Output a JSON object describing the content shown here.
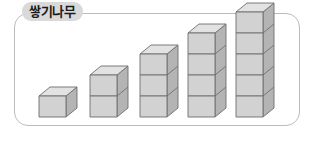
{
  "figure": {
    "title": "쌓기나무",
    "panel": {
      "border_color": "#b9bcbe",
      "background_color": "#ffffff",
      "corner_radius": "14px"
    },
    "badge": {
      "background_color": "#d9d9d9",
      "text_color": "#1a1a1a"
    }
  },
  "chart_data": {
    "type": "bar",
    "title": "쌓기나무",
    "xlabel": "",
    "ylabel": "",
    "categories": [
      "1",
      "2",
      "3",
      "4",
      "5"
    ],
    "values": [
      1,
      2,
      3,
      4,
      5
    ],
    "unit": "cube",
    "ylim": [
      0,
      5
    ],
    "grid": false,
    "legend": null
  },
  "cubes": {
    "face_front_color": "#d2d2d2",
    "face_side_color": "#b4b4b4",
    "face_top_color": "#e2e2e2",
    "edge_color": "#6e6e6e",
    "cube_width": 27,
    "cube_height": 21,
    "depth_x": 11,
    "depth_y": 9,
    "stacks": [
      {
        "id": "stack-1",
        "count": 1,
        "left": 24,
        "label": "1 cube"
      },
      {
        "id": "stack-2",
        "count": 2,
        "left": 75,
        "label": "2 cubes"
      },
      {
        "id": "stack-3",
        "count": 3,
        "left": 125,
        "label": "3 cubes"
      },
      {
        "id": "stack-4",
        "count": 4,
        "left": 173,
        "label": "4 cubes"
      },
      {
        "id": "stack-5",
        "count": 5,
        "left": 221,
        "label": "5 cubes"
      }
    ]
  }
}
